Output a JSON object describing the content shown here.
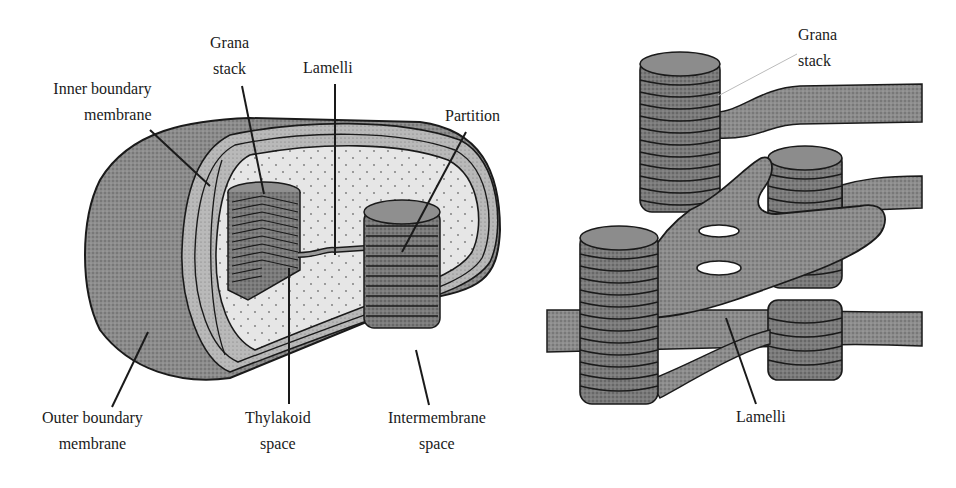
{
  "figure": {
    "left_panel": {
      "title": "Chloroplast cross-section",
      "labels": {
        "grana_stack": {
          "line1": "Grana",
          "line2": "stack"
        },
        "lamelli": {
          "line1": "Lamelli"
        },
        "inner_boundary_membrane": {
          "line1": "Inner boundary",
          "line2": "membrane"
        },
        "partition": {
          "line1": "Partition"
        },
        "outer_boundary_membrane": {
          "line1": "Outer boundary",
          "line2": "membrane"
        },
        "thylakoid_space": {
          "line1": "Thylakoid",
          "line2": "space"
        },
        "intermembrane_space": {
          "line1": "Intermembrane",
          "line2": "space"
        }
      }
    },
    "right_panel": {
      "title": "Grana and lamellae detail",
      "labels": {
        "grana_stack": {
          "line1": "Grana",
          "line2": "stack"
        },
        "lamelli": {
          "line1": "Lamelli"
        }
      }
    },
    "colors": {
      "outer_shell": "#8a8a8a",
      "stroma": "#e4e4e4",
      "intermembrane": "#b8b8b8",
      "grana": "#7a7a7a",
      "outline": "#1a1a1a"
    }
  }
}
